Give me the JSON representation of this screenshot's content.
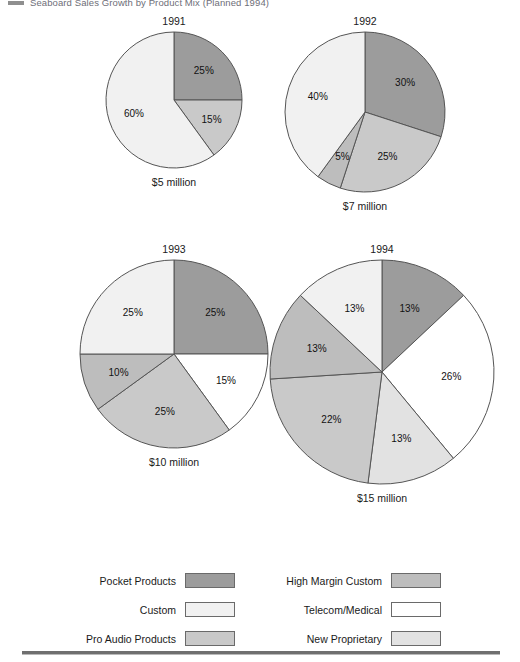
{
  "title": {
    "marker": "title-bullet",
    "text": "Seaboard Sales Growth by Product Mix (Planned 1994)"
  },
  "chart_data": {
    "type": "pie",
    "title": "Seaboard Sales Growth by Product Mix (Planned 1994)",
    "legend_position": "bottom",
    "categories": [
      "Pocket Products",
      "Custom",
      "Pro Audio Products",
      "High Margin Custom",
      "Telecom/Medical",
      "New Proprietary"
    ],
    "category_colors": {
      "Pocket Products": "#9c9c9c",
      "Custom": "#f1f1f1",
      "Pro Audio Products": "#c9c9c9",
      "High Margin Custom": "#bdbdbd",
      "Telecom/Medical": "#ffffff",
      "New Proprietary": "#e2e2e2"
    },
    "charts": [
      {
        "year": "1991",
        "total": "$5 million",
        "radius": 68,
        "slices": [
          {
            "category": "Pocket Products",
            "label": "25%",
            "value": 25
          },
          {
            "category": "Pro Audio Products",
            "label": "15%",
            "value": 15
          },
          {
            "category": "Custom",
            "label": "60%",
            "value": 60
          }
        ]
      },
      {
        "year": "1992",
        "total": "$7 million",
        "radius": 80,
        "slices": [
          {
            "category": "Pocket Products",
            "label": "30%",
            "value": 30
          },
          {
            "category": "Pro Audio Products",
            "label": "25%",
            "value": 25
          },
          {
            "category": "High Margin Custom",
            "label": "5%",
            "value": 5
          },
          {
            "category": "Custom",
            "label": "40%",
            "value": 40
          }
        ]
      },
      {
        "year": "1993",
        "total": "$10 million",
        "radius": 94,
        "slices": [
          {
            "category": "Pocket Products",
            "label": "25%",
            "value": 25
          },
          {
            "category": "Telecom/Medical",
            "label": "15%",
            "value": 15
          },
          {
            "category": "Pro Audio Products",
            "label": "25%",
            "value": 25
          },
          {
            "category": "High Margin Custom",
            "label": "10%",
            "value": 10
          },
          {
            "category": "Custom",
            "label": "25%",
            "value": 25
          }
        ]
      },
      {
        "year": "1994",
        "total": "$15 million",
        "radius": 112,
        "slices": [
          {
            "category": "Pocket Products",
            "label": "13%",
            "value": 13
          },
          {
            "category": "Telecom/Medical",
            "label": "26%",
            "value": 26
          },
          {
            "category": "New Proprietary",
            "label": "13%",
            "value": 13
          },
          {
            "category": "Pro Audio Products",
            "label": "22%",
            "value": 22
          },
          {
            "category": "High Margin Custom",
            "label": "13%",
            "value": 13
          },
          {
            "category": "Custom",
            "label": "13%",
            "value": 13
          }
        ]
      }
    ]
  },
  "legend": {
    "items": [
      {
        "label": "Pocket Products",
        "color": "#9c9c9c"
      },
      {
        "label": "High Margin Custom",
        "color": "#bdbdbd"
      },
      {
        "label": "Custom",
        "color": "#f1f1f1"
      },
      {
        "label": "Telecom/Medical",
        "color": "#ffffff"
      },
      {
        "label": "Pro Audio Products",
        "color": "#c9c9c9"
      },
      {
        "label": "New Proprietary",
        "color": "#e2e2e2"
      }
    ]
  }
}
